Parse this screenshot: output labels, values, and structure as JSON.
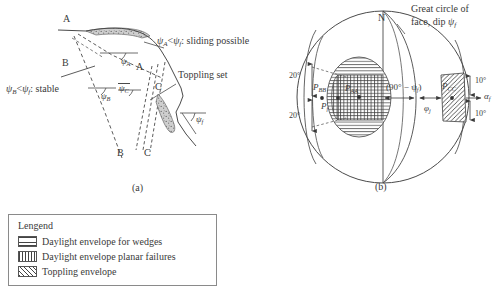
{
  "figure": {
    "background": "#ffffff",
    "ink": "#3a3a3a",
    "panels": [
      {
        "id": "a",
        "caption": "(a)"
      },
      {
        "id": "b",
        "caption": "(b)"
      }
    ]
  },
  "panel_a": {
    "caption": "(a)",
    "description": "Rock slope cross-section showing discontinuity sets A, B and C with their dips relative to the face dip",
    "annotations": {
      "sliding_note": "ψₐ < ψf : sliding possible",
      "sliding_note_parts": {
        "left": "ψ",
        "left_sub": "A",
        "rel": "<",
        "right": "ψ",
        "right_sub": "f",
        "text": ": sliding possible"
      },
      "stable_note": "ψʙ < ψf : stable",
      "stable_note_parts": {
        "left": "ψ",
        "left_sub": "B",
        "rel": "<",
        "right": "ψ",
        "right_sub": "f",
        "text": ": stable"
      },
      "toppling_note": "Toppling set"
    },
    "set_labels": [
      {
        "name": "A-upper",
        "text": "A"
      },
      {
        "name": "A-lower",
        "text": "A"
      },
      {
        "name": "B-upper",
        "text": "B"
      },
      {
        "name": "B-lower",
        "text": "B"
      },
      {
        "name": "C-upper",
        "text": "C"
      },
      {
        "name": "C-lower",
        "text": "C"
      }
    ],
    "angle_labels": [
      {
        "name": "psi-A",
        "symbol": "ψ",
        "sub": "A"
      },
      {
        "name": "psi-B",
        "symbol": "ψ",
        "sub": "B"
      },
      {
        "name": "psi-C",
        "symbol": "ψ",
        "sub": "C"
      },
      {
        "name": "psi-f",
        "symbol": "ψ",
        "sub": "f"
      }
    ]
  },
  "panel_b": {
    "caption": "(b)",
    "description": "Equal-area stereonet showing daylight envelopes and toppling envelope",
    "north_label": "N",
    "great_circle_note_line1": "Great circle of",
    "great_circle_note_line2_pre": "face, dip ",
    "great_circle_note_symbol": "ψ",
    "great_circle_note_sub": "f",
    "angle_markers": [
      {
        "name": "upper-20deg",
        "text": "20°"
      },
      {
        "name": "lower-20deg",
        "text": "20°"
      },
      {
        "name": "upper-10deg",
        "text": "10°"
      },
      {
        "name": "lower-10deg",
        "text": "10°"
      }
    ],
    "pole_labels": [
      {
        "name": "pole-P-BB",
        "symbol": "P",
        "sub": "BB"
      },
      {
        "name": "pole-P-AA",
        "symbol": "P",
        "sub": "AA"
      },
      {
        "name": "pole-P-CC",
        "symbol": "P",
        "sub": "CC"
      },
      {
        "name": "pole-P-f",
        "symbol": "P",
        "sub": "f"
      }
    ],
    "dimension_labels": [
      {
        "name": "ninety-minus-psi-f",
        "text": "(90° − ψ",
        "sub": "f",
        "tail": ")"
      },
      {
        "name": "phi-j",
        "symbol": "φ",
        "sub": "j"
      },
      {
        "name": "alpha-f",
        "symbol": "α",
        "sub": "f"
      }
    ]
  },
  "legend": {
    "title": "Lengend",
    "items": [
      {
        "name": "daylight-wedges",
        "pattern": "horizontal-hatch",
        "label": "Daylight envelope for wedges"
      },
      {
        "name": "daylight-planar",
        "pattern": "vertical-hatch",
        "label": "Daylight envelope planar failures"
      },
      {
        "name": "toppling",
        "pattern": "diagonal-hatch",
        "label": "Toppling envelope"
      }
    ]
  }
}
